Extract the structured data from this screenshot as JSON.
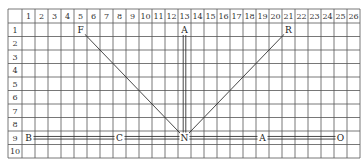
{
  "grid": {
    "columns": [
      "1",
      "2",
      "3",
      "4",
      "5",
      "6",
      "7",
      "8",
      "9",
      "10",
      "11",
      "12",
      "13",
      "14",
      "15",
      "16",
      "17",
      "18",
      "19",
      "20",
      "21",
      "22",
      "23",
      "24",
      "25",
      "26"
    ],
    "rows": [
      "1",
      "2",
      "3",
      "4",
      "5",
      "6",
      "7",
      "8",
      "9",
      "10"
    ]
  },
  "points": [
    {
      "id": "F",
      "label": "F",
      "col": 5,
      "row": 1
    },
    {
      "id": "A_top",
      "label": "A",
      "col": 13,
      "row": 1
    },
    {
      "id": "R",
      "label": "R",
      "col": 21,
      "row": 1
    },
    {
      "id": "B",
      "label": "B",
      "col": 1,
      "row": 9
    },
    {
      "id": "C",
      "label": "C",
      "col": 8,
      "row": 9
    },
    {
      "id": "N",
      "label": "N",
      "col": 13,
      "row": 9
    },
    {
      "id": "A_bottom",
      "label": "A",
      "col": 19,
      "row": 9
    },
    {
      "id": "O",
      "label": "O",
      "col": 25,
      "row": 9
    }
  ],
  "connections": [
    {
      "from": "F",
      "to": "N",
      "style": "single"
    },
    {
      "from": "R",
      "to": "N",
      "style": "single"
    },
    {
      "from": "A_top",
      "to": "N",
      "style": "double"
    },
    {
      "from": "B",
      "to": "C",
      "style": "double"
    },
    {
      "from": "C",
      "to": "N",
      "style": "double"
    },
    {
      "from": "N",
      "to": "A_bottom",
      "style": "double"
    },
    {
      "from": "A_bottom",
      "to": "O",
      "style": "double"
    }
  ]
}
